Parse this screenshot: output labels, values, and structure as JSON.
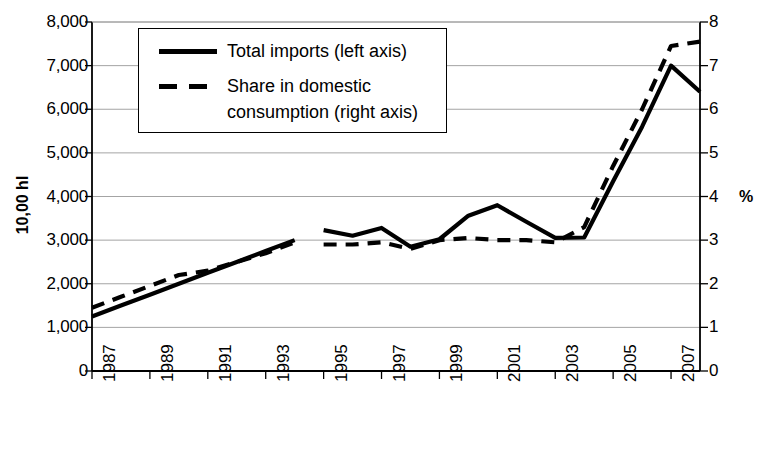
{
  "chart_data": {
    "type": "line",
    "title": "",
    "xlabel": "",
    "ylabel": "10,00 hl",
    "y2label": "%",
    "grid": true,
    "legend_position": "top-left",
    "xlim": [
      1987,
      2008
    ],
    "ylim": [
      0,
      8000
    ],
    "y2lim": [
      0,
      8
    ],
    "x_tick_labels": [
      "1987",
      "1989",
      "1991",
      "1993",
      "1995",
      "1997",
      "1999",
      "2001",
      "2003",
      "2005",
      "2007"
    ],
    "x_tick_values": [
      1987,
      1989,
      1991,
      1993,
      1995,
      1997,
      1999,
      2001,
      2003,
      2005,
      2007
    ],
    "y_tick_labels": [
      "0",
      "1,000",
      "2,000",
      "3,000",
      "4,000",
      "5,000",
      "6,000",
      "7,000",
      "8,000"
    ],
    "y_tick_values": [
      0,
      1000,
      2000,
      3000,
      4000,
      5000,
      6000,
      7000,
      8000
    ],
    "y2_tick_labels": [
      "0",
      "1",
      "2",
      "3",
      "4",
      "5",
      "6",
      "7",
      "8"
    ],
    "y2_tick_values": [
      0,
      1,
      2,
      3,
      4,
      5,
      6,
      7,
      8
    ],
    "series": [
      {
        "name": "Total imports (left axis)",
        "axis": "left",
        "style": "solid",
        "color": "#000000",
        "x": [
          1987,
          1988,
          1989,
          1990,
          1991,
          1992,
          1993,
          1994,
          1995,
          1996,
          1997,
          1998,
          1999,
          2000,
          2001,
          2002,
          2003,
          2004,
          2005,
          2006,
          2007,
          2008
        ],
        "values": [
          1250,
          1500,
          1750,
          2000,
          2250,
          2500,
          2750,
          3000,
          3230,
          3100,
          3280,
          2850,
          3020,
          3560,
          3800,
          3420,
          3050,
          3060,
          4350,
          5600,
          7000,
          6400
        ]
      },
      {
        "name": "Share in domestic consumption (right axis)",
        "axis": "right",
        "style": "dashed",
        "color": "#000000",
        "x": [
          1987,
          1988,
          1989,
          1990,
          1991,
          1992,
          1993,
          1994,
          1995,
          1996,
          1997,
          1998,
          1999,
          2000,
          2001,
          2002,
          2003,
          2004,
          2005,
          2006,
          2007,
          2008
        ],
        "values": [
          1.45,
          1.7,
          1.95,
          2.2,
          2.3,
          2.5,
          2.7,
          2.95,
          2.9,
          2.9,
          2.95,
          2.8,
          3.0,
          3.05,
          3.0,
          3.0,
          2.95,
          3.3,
          4.7,
          6.0,
          7.45,
          7.55
        ]
      }
    ],
    "series_breaks": [
      [
        1994,
        1995
      ]
    ]
  },
  "legend": {
    "items": [
      {
        "label": "Total imports (left axis)",
        "style": "solid"
      },
      {
        "label": "Share in domestic\nconsumption (right axis)",
        "style": "dashed"
      }
    ]
  },
  "axes": {
    "left_title": "10,00 hl",
    "right_title": "%"
  }
}
